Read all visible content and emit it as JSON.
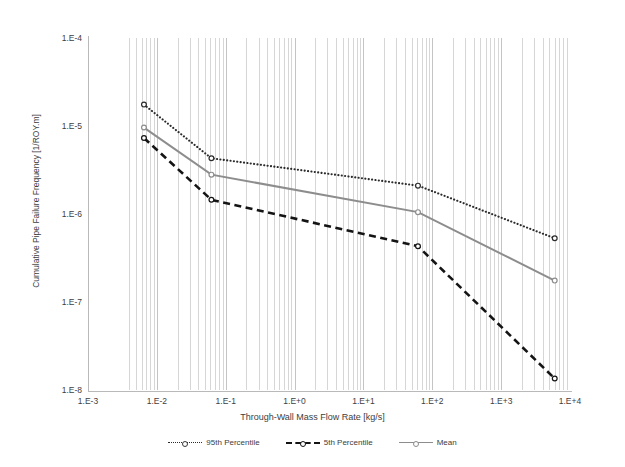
{
  "chart_data": {
    "type": "line",
    "title": "",
    "xlabel": "Through-Wall Mass Flow Rate [kg/s]",
    "ylabel": "Cumulative Pipe Failure Frequency [1/ROY.m]",
    "xscale": "log",
    "yscale": "log",
    "xlim": [
      0.001,
      10000
    ],
    "ylim": [
      1e-08,
      0.0001
    ],
    "grid": true,
    "grid_minor": true,
    "legend_position": "bottom",
    "xtick_labels": [
      "1.E-3",
      "1.E-2",
      "1.E-1",
      "1.E+0",
      "1.E+1",
      "1.E+2",
      "1.E+3",
      "1.E+4"
    ],
    "xtick_values": [
      0.001,
      0.01,
      0.1,
      1,
      10,
      100,
      1000,
      10000
    ],
    "ytick_labels": [
      "1.E-4",
      "1.E-5",
      "1.E-6",
      "1.E-7",
      "1.E-8"
    ],
    "ytick_values": [
      0.0001,
      1e-05,
      1e-06,
      1e-07,
      1e-08
    ],
    "x": [
      0.0065,
      0.062,
      62.0,
      6000.0
    ],
    "series": [
      {
        "name": "95th Percentile",
        "style": "dotted",
        "color": "#2b2b2b",
        "marker": "circle",
        "values": [
          1.75e-05,
          4.3e-06,
          2.1e-06,
          5.3e-07
        ]
      },
      {
        "name": "5th Percentile",
        "style": "dashed",
        "color": "#141414",
        "marker": "circle",
        "values": [
          7.3e-06,
          1.45e-06,
          4.3e-07,
          1.35e-08
        ]
      },
      {
        "name": "Mean",
        "style": "solid",
        "color": "#8d8d8d",
        "marker": "circle",
        "values": [
          9.6e-06,
          2.8e-06,
          1.05e-06,
          1.75e-07
        ]
      }
    ],
    "minor_gridlines_x": [
      0.004,
      0.005,
      0.006,
      0.007,
      0.008,
      0.009,
      0.01,
      0.02,
      0.03,
      0.04,
      0.05,
      0.06,
      0.07,
      0.08,
      0.09,
      0.1,
      0.2,
      0.3,
      0.4,
      0.5,
      0.6,
      0.7,
      0.8,
      0.9,
      1,
      2,
      3,
      4,
      5,
      6,
      7,
      8,
      9,
      10,
      20,
      30,
      40,
      50,
      60,
      70,
      80,
      90,
      100,
      200,
      300,
      400,
      500,
      600,
      700,
      800,
      900,
      1000,
      2000,
      3000,
      4000,
      5000,
      6000,
      7000,
      8000,
      9000
    ]
  },
  "legend": {
    "items": [
      {
        "label": "95th Percentile"
      },
      {
        "label": "5th Percentile"
      },
      {
        "label": "Mean"
      }
    ]
  }
}
